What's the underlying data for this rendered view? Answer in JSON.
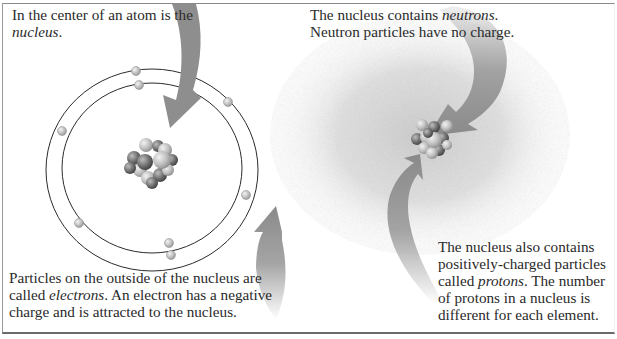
{
  "figure": {
    "captions": {
      "nucleus": {
        "before": "In the center of an atom is the ",
        "term": "nucleus",
        "after": "."
      },
      "neutrons": {
        "before": "The nucleus contains ",
        "term": "neutrons",
        "after": ". Neutron particles have no charge."
      },
      "electrons": {
        "before": "Particles on the outside of the nucleus are called ",
        "term": "electrons",
        "after": ". An electron has a negative charge and is attracted to the nucleus."
      },
      "protons": {
        "before": "The nucleus also contains positively-charged particles called ",
        "term": "protons",
        "after": ". The number of protons in a nucleus is different for each element."
      }
    },
    "left_panel": {
      "orbits": 2,
      "electrons_count": 8,
      "nucleus_label": "nucleus"
    },
    "right_panel": {
      "cloud": "electron cloud",
      "nucleus_label": "nucleus"
    },
    "colors": {
      "text": "#2a2a2a",
      "arrow": "#8e8e8e",
      "orbit": "#2b2b2b",
      "electron": "#c8c8c8",
      "cloud": "#bdbdbd"
    }
  }
}
